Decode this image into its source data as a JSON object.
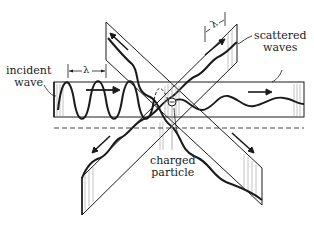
{
  "diagram": {
    "labels": {
      "incident_line1": "incident",
      "incident_line2": "wave",
      "scattered_line1": "scattered",
      "scattered_line2": "waves",
      "particle_line1": "charged",
      "particle_line2": "particle",
      "lambda_incident": "λ",
      "lambda_scattered": "λ"
    },
    "colors": {
      "ink": "#1a1a1a",
      "paper": "#ffffff",
      "hatch": "#9a9a9a"
    }
  }
}
